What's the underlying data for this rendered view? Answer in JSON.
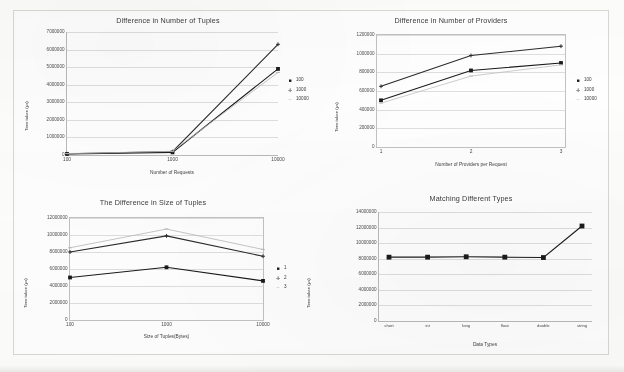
{
  "page": {
    "background_color": "#fdfdfc",
    "frame_color": "#d8d8d6"
  },
  "charts": [
    {
      "id": "difference-in-number-of-tuples",
      "title": "Difference in Number of Tuples",
      "xlabel": "Number of Requests",
      "ylabel": "Time taken (µs)",
      "ytick_labels": [
        "7000000",
        "6000000",
        "5000000",
        "4000000",
        "3000000",
        "2000000",
        "1000000",
        "0"
      ],
      "xtick_labels": [
        "100",
        "1000",
        "10000"
      ],
      "legend": [
        "100",
        "1000",
        "10000"
      ]
    },
    {
      "id": "difference-in-number-of-providers",
      "title": "Difference in Number of Providers",
      "xlabel": "Number of Providers per Request",
      "ylabel": "Time taken (µs)",
      "ytick_labels": [
        "1200000",
        "1000000",
        "800000",
        "600000",
        "400000",
        "200000",
        "0"
      ],
      "xtick_labels": [
        "1",
        "2",
        "3"
      ],
      "legend": [
        "100",
        "1000",
        "10000"
      ]
    },
    {
      "id": "the-difference-in-size-of-tuples",
      "title": "The Difference in Size of Tuples",
      "xlabel": "Size of Tuples(Bytes)",
      "ylabel": "Time taken (µs)",
      "ylabel_right": "Time taken  (µs)",
      "ytick_labels": [
        "12000000",
        "10000000",
        "8000000",
        "6000000",
        "4000000",
        "2000000",
        "0"
      ],
      "xtick_labels": [
        "100",
        "1000",
        "10000"
      ],
      "legend": [
        "1",
        "2",
        "3"
      ]
    },
    {
      "id": "matching-different-types",
      "title": "Matching Different Types",
      "xlabel": "Data Types",
      "ylabel": "Time taken (µs)",
      "ytick_labels": [
        "14000000",
        "12000000",
        "10000000",
        "8000000",
        "6000000",
        "4000000",
        "2000000",
        "0"
      ],
      "xtick_labels": [
        "short",
        "int",
        "long",
        "float",
        "double",
        "string"
      ],
      "legend": []
    }
  ],
  "chart_data": [
    {
      "type": "line",
      "title": "Difference in Number of Tuples",
      "xlabel": "Number of Requests",
      "ylabel": "Time taken (µs)",
      "categories": [
        "100",
        "1000",
        "10000"
      ],
      "ylim": [
        0,
        7000000
      ],
      "yticks": [
        0,
        1000000,
        2000000,
        3000000,
        4000000,
        5000000,
        6000000,
        7000000
      ],
      "grid": true,
      "legend_position": "right",
      "series": [
        {
          "name": "100",
          "marker": "square",
          "color": "#1a1a1a",
          "values": [
            60000,
            150000,
            4900000
          ]
        },
        {
          "name": "1000",
          "marker": "cross",
          "color": "#2a2a2a",
          "values": [
            70000,
            190000,
            6300000
          ]
        },
        {
          "name": "10000",
          "marker": "dash",
          "color": "#b8b8b8",
          "values": [
            80000,
            210000,
            4700000
          ]
        }
      ]
    },
    {
      "type": "line",
      "title": "Difference in Number of Providers",
      "xlabel": "Number of Providers per Request",
      "ylabel": "Time taken (µs)",
      "categories": [
        "1",
        "2",
        "3"
      ],
      "ylim": [
        0,
        1200000
      ],
      "yticks": [
        0,
        200000,
        400000,
        600000,
        800000,
        1000000,
        1200000
      ],
      "grid": true,
      "legend_position": "right",
      "series": [
        {
          "name": "100",
          "marker": "square",
          "color": "#1a1a1a",
          "values": [
            500000,
            820000,
            900000
          ]
        },
        {
          "name": "1000",
          "marker": "cross",
          "color": "#2a2a2a",
          "values": [
            650000,
            980000,
            1080000
          ]
        },
        {
          "name": "10000",
          "marker": "dash",
          "color": "#c0c0c0",
          "values": [
            470000,
            760000,
            880000
          ]
        }
      ]
    },
    {
      "type": "line",
      "title": "The Difference in Size of Tuples",
      "xlabel": "Size of Tuples(Bytes)",
      "ylabel": "Time taken (µs)",
      "categories": [
        "100",
        "1000",
        "10000"
      ],
      "ylim": [
        0,
        12000000
      ],
      "yticks": [
        0,
        2000000,
        4000000,
        6000000,
        8000000,
        10000000,
        12000000
      ],
      "grid": true,
      "legend_position": "right",
      "series": [
        {
          "name": "1",
          "marker": "square",
          "color": "#1a1a1a",
          "values": [
            5000000,
            6200000,
            4600000
          ]
        },
        {
          "name": "2",
          "marker": "cross",
          "color": "#2a2a2a",
          "values": [
            8000000,
            9900000,
            7500000
          ]
        },
        {
          "name": "3",
          "marker": "dash",
          "color": "#b8b8b8",
          "values": [
            8500000,
            10700000,
            8300000
          ]
        }
      ]
    },
    {
      "type": "line",
      "title": "Matching Different Types",
      "xlabel": "Data Types",
      "ylabel": "Time taken (µs)",
      "categories": [
        "short",
        "int",
        "long",
        "float",
        "double",
        "string"
      ],
      "ylim": [
        0,
        14000000
      ],
      "yticks": [
        0,
        2000000,
        4000000,
        6000000,
        8000000,
        10000000,
        12000000,
        14000000
      ],
      "grid": true,
      "legend_position": "none",
      "series": [
        {
          "name": "time",
          "marker": "square",
          "color": "#1a1a1a",
          "values": [
            8200000,
            8200000,
            8250000,
            8200000,
            8150000,
            12200000
          ]
        }
      ]
    }
  ]
}
